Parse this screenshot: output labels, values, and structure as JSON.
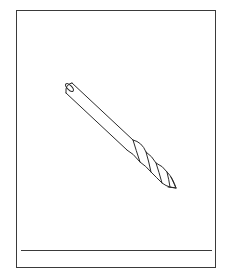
{
  "card": {
    "border_color": "#3a3a3a",
    "background": "#ffffff"
  },
  "illustration": {
    "subject": "drill-bit",
    "style": "black line drawing",
    "stroke_color": "#2a2a2a",
    "icon": "drill-bit-icon"
  },
  "caption": {
    "text": ""
  }
}
